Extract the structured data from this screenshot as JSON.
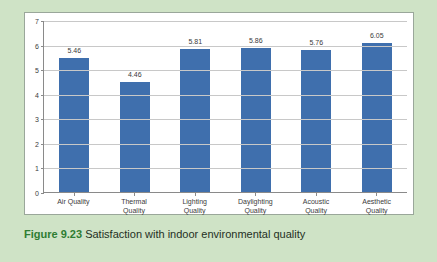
{
  "caption": {
    "label": "Figure 9.23",
    "text": "Satisfaction with indoor environmental quality"
  },
  "colors": {
    "bar": "#3f6fad",
    "page_background": "#cfe3c6",
    "panel_background": "#ffffff",
    "gridline": "#c8c8c8",
    "axis": "#8a8a8a",
    "caption_label": "#2e7d32"
  },
  "chart_data": {
    "type": "bar",
    "title": "",
    "xlabel": "",
    "ylabel": "",
    "ylim": [
      0,
      7
    ],
    "yticks": [
      "0",
      "1",
      "2",
      "3",
      "4",
      "5",
      "6",
      "7"
    ],
    "grid": true,
    "legend": "none",
    "categories": [
      "Air Quality",
      "Thermal Quality",
      "Lighting Quality",
      "Daylighting Quality",
      "Acoustic Quality",
      "Aesthetic Quality"
    ],
    "category_lines": [
      [
        "Air Quality"
      ],
      [
        "Thermal",
        "Quality"
      ],
      [
        "Lighting",
        "Quality"
      ],
      [
        "Daylighting",
        "Quality"
      ],
      [
        "Acoustic",
        "Quality"
      ],
      [
        "Aesthetic",
        "Quality"
      ]
    ],
    "values": [
      5.46,
      4.46,
      5.81,
      5.86,
      5.76,
      6.05
    ],
    "value_labels": [
      "5.46",
      "4.46",
      "5.81",
      "5.86",
      "5.76",
      "6.05"
    ]
  }
}
